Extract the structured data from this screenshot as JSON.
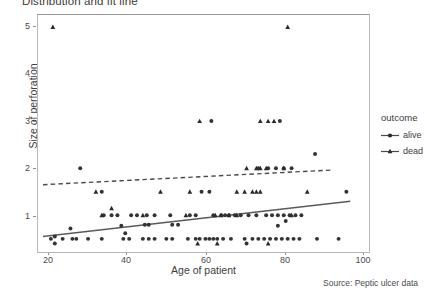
{
  "chart_data": {
    "type": "scatter",
    "title": "Distribution and fit line",
    "xlabel": "Age of patient",
    "ylabel": "Size of perforation",
    "xlim": [
      16,
      102
    ],
    "ylim": [
      0.3,
      5.35
    ],
    "xticks": [
      20,
      40,
      60,
      80,
      100
    ],
    "yticks": [
      1,
      2,
      3,
      4,
      5
    ],
    "grid": false,
    "legend": {
      "title": "outcome",
      "position": "right",
      "entries": [
        {
          "label": "alive",
          "marker": "circle",
          "line": "solid",
          "color": "#3d3d3d"
        },
        {
          "label": "dead",
          "marker": "triangle",
          "line": "dashed",
          "color": "#3d3d3d"
        }
      ]
    },
    "footnote": "Source: Peptic ulcer data",
    "series": [
      {
        "name": "alive",
        "marker": "circle",
        "color": "#333333",
        "points": [
          [
            21.5,
            0.55
          ],
          [
            20.5,
            0.5
          ],
          [
            23.5,
            0.5
          ],
          [
            26,
            0.5
          ],
          [
            27,
            0.5
          ],
          [
            30,
            0.5
          ],
          [
            33.5,
            0.5
          ],
          [
            21.5,
            0.4
          ],
          [
            39,
            0.5
          ],
          [
            40.5,
            0.5
          ],
          [
            44,
            0.5
          ],
          [
            45.5,
            0.5
          ],
          [
            47,
            0.5
          ],
          [
            50,
            0.5
          ],
          [
            51.5,
            0.5
          ],
          [
            55.5,
            0.5
          ],
          [
            57.5,
            0.5
          ],
          [
            58.5,
            0.5
          ],
          [
            60,
            0.5
          ],
          [
            61,
            0.5
          ],
          [
            62,
            0.5
          ],
          [
            63,
            0.5
          ],
          [
            64.5,
            0.5
          ],
          [
            66.5,
            0.5
          ],
          [
            70,
            0.5
          ],
          [
            72,
            0.5
          ],
          [
            73.5,
            0.5
          ],
          [
            75,
            0.5
          ],
          [
            76.5,
            0.5
          ],
          [
            78,
            0.5
          ],
          [
            79.5,
            0.5
          ],
          [
            81,
            0.5
          ],
          [
            82.5,
            0.5
          ],
          [
            84,
            0.5
          ],
          [
            88.5,
            0.5
          ],
          [
            94,
            0.5
          ],
          [
            39.5,
            0.62
          ],
          [
            70.5,
            0.4
          ],
          [
            25.5,
            0.72
          ],
          [
            38.5,
            0.78
          ],
          [
            44.5,
            0.8
          ],
          [
            45.5,
            0.8
          ],
          [
            51.5,
            0.8
          ],
          [
            53,
            0.8
          ],
          [
            45,
            1.0
          ],
          [
            47,
            1.0
          ],
          [
            51,
            1.0
          ],
          [
            56,
            1.0
          ],
          [
            57.5,
            1.0
          ],
          [
            62,
            1.0
          ],
          [
            64,
            1.0
          ],
          [
            65,
            1.0
          ],
          [
            66,
            1.0
          ],
          [
            67.5,
            1.0
          ],
          [
            69,
            1.0
          ],
          [
            71,
            1.0
          ],
          [
            73,
            1.0
          ],
          [
            75.5,
            1.0
          ],
          [
            77,
            1.0
          ],
          [
            78.5,
            1.0
          ],
          [
            80,
            1.0
          ],
          [
            81.5,
            1.0
          ],
          [
            83,
            1.0
          ],
          [
            84.5,
            1.0
          ],
          [
            34,
            1.0
          ],
          [
            36,
            1.0
          ],
          [
            37.5,
            1.0
          ],
          [
            41,
            1.0
          ],
          [
            42.5,
            1.0
          ],
          [
            78.5,
            0.78
          ],
          [
            80.5,
            0.88
          ],
          [
            33.5,
            1.5
          ],
          [
            59,
            1.5
          ],
          [
            61,
            1.5
          ],
          [
            96,
            1.5
          ],
          [
            28,
            2.0
          ],
          [
            73.5,
            2.0
          ],
          [
            76,
            2.0
          ],
          [
            78,
            2.0
          ],
          [
            80,
            2.0
          ],
          [
            82,
            2.0
          ],
          [
            61.5,
            3.0
          ],
          [
            79,
            3.0
          ],
          [
            88,
            2.3
          ]
        ]
      },
      {
        "name": "dead",
        "marker": "triangle",
        "color": "#2a2a2a",
        "points": [
          [
            21,
            5.0
          ],
          [
            81,
            5.0
          ],
          [
            58.5,
            3.0
          ],
          [
            74,
            3.0
          ],
          [
            76,
            3.0
          ],
          [
            77.5,
            3.0
          ],
          [
            48.5,
            1.5
          ],
          [
            56,
            1.5
          ],
          [
            68,
            1.5
          ],
          [
            70,
            1.5
          ],
          [
            72,
            1.5
          ],
          [
            73,
            1.5
          ],
          [
            74,
            1.5
          ],
          [
            86,
            1.5
          ],
          [
            32,
            1.5
          ],
          [
            73,
            2.0
          ],
          [
            74,
            2.0
          ],
          [
            75.5,
            2.0
          ],
          [
            70.5,
            2.0
          ],
          [
            80,
            2.0
          ],
          [
            33.5,
            1.0
          ],
          [
            44,
            1.0
          ],
          [
            55,
            1.0
          ],
          [
            62.5,
            1.0
          ],
          [
            64,
            1.0
          ],
          [
            66,
            1.0
          ],
          [
            68,
            1.0
          ],
          [
            82,
            1.0
          ],
          [
            36,
            1.15
          ],
          [
            58,
            0.4
          ],
          [
            63,
            0.4
          ],
          [
            76,
            0.4
          ]
        ]
      }
    ],
    "fit_lines": [
      {
        "name": "alive",
        "style": "solid",
        "color": "#5a5a5a",
        "x": [
          18.5,
          97
        ],
        "y": [
          0.55,
          1.3
        ]
      },
      {
        "name": "dead",
        "style": "dashed",
        "color": "#4a4a4a",
        "x": [
          18.5,
          92
        ],
        "y": [
          1.65,
          1.96
        ]
      }
    ]
  }
}
